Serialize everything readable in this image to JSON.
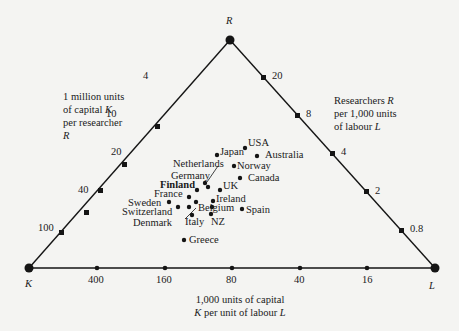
{
  "vertices": {
    "top": "R",
    "left": "K",
    "right": "L"
  },
  "axis_notes": {
    "left": {
      "line1": "1 million units",
      "line2_a": "of capital ",
      "line2_var": "K",
      "line3": "per researcher",
      "line4_var": "R"
    },
    "right": {
      "line1_a": "Researchers ",
      "line1_var": "R",
      "line2": "per  1,000 units",
      "line3_a": "of  labour ",
      "line3_var": "L"
    },
    "bottom": {
      "line1": "1,000 units of capital",
      "line2_var1": "K",
      "line2_mid": " per unit of labour ",
      "line2_var2": "L"
    }
  },
  "ticks": {
    "left_edge": [
      "4",
      "10",
      "20",
      "40",
      "100"
    ],
    "right_edge": [
      "20",
      "8",
      "4",
      "2",
      "0.8"
    ],
    "bottom_edge": [
      "400",
      "160",
      "80",
      "40",
      "16"
    ]
  },
  "countries": [
    {
      "name": "USA",
      "bold": false
    },
    {
      "name": "Japan",
      "bold": false
    },
    {
      "name": "Australia",
      "bold": false
    },
    {
      "name": "Netherlands",
      "bold": false
    },
    {
      "name": "Norway",
      "bold": false
    },
    {
      "name": "Germany",
      "bold": false
    },
    {
      "name": "Finland",
      "bold": true
    },
    {
      "name": "Canada",
      "bold": false
    },
    {
      "name": "UK",
      "bold": false
    },
    {
      "name": "France",
      "bold": false
    },
    {
      "name": "Ireland",
      "bold": false
    },
    {
      "name": "Sweden",
      "bold": false
    },
    {
      "name": "Switzerland",
      "bold": false
    },
    {
      "name": "Belgium",
      "bold": false
    },
    {
      "name": "Spain",
      "bold": false
    },
    {
      "name": "Denmark",
      "bold": false
    },
    {
      "name": "Italy",
      "bold": false
    },
    {
      "name": "NZ",
      "bold": false
    },
    {
      "name": "Greece",
      "bold": false
    }
  ],
  "colors": {
    "background": "#f4f4f2",
    "ink": "#151515"
  }
}
